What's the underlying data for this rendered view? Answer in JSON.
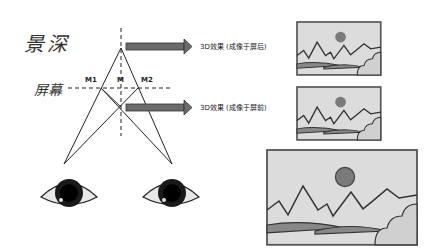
{
  "title": "景深",
  "screen_label": "屏幕",
  "points": {
    "m1": "M1",
    "m": "M",
    "m2": "M2"
  },
  "captions": {
    "behind_screen": "3D效果 (成像于屏后)",
    "in_front_of_screen": "3D效果 (成像于屏前)"
  },
  "colors": {
    "line": "#222222",
    "arrow": "#6b6b6b",
    "landscape_sky": "#d9d9d9",
    "sun": "#7a7a7a",
    "frame": "#555555",
    "eye_iris": "#1a1a1a"
  }
}
